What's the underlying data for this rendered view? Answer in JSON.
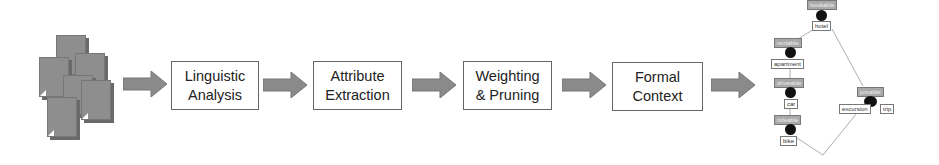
{
  "pipeline": {
    "input": {
      "icon": "document-stack-icon"
    },
    "steps": [
      {
        "line1": "Linguistic",
        "line2": "Analysis"
      },
      {
        "line1": "Attribute",
        "line2": "Extraction"
      },
      {
        "line1": "Weighting",
        "line2": "& Pruning"
      },
      {
        "line1": "Formal",
        "line2": "Context"
      }
    ],
    "arrow_color": "#8a8a8a"
  },
  "lattice": {
    "attributes": [
      "bookable",
      "rentable",
      "driveable",
      "rideable",
      "joinable"
    ],
    "objects": [
      "hotel",
      "apartment",
      "car",
      "bike",
      "excursion",
      "trip"
    ]
  }
}
